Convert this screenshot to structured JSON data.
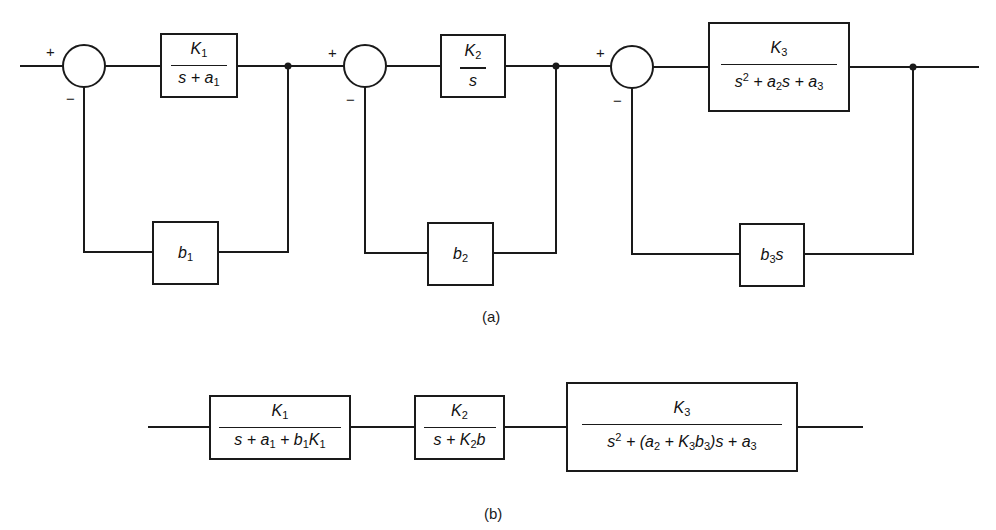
{
  "diagram_a": {
    "label": "(a)",
    "summing_junctions": [
      {
        "id": "sum1",
        "plus": "+",
        "minus": "−"
      },
      {
        "id": "sum2",
        "plus": "+",
        "minus": "−"
      },
      {
        "id": "sum3",
        "plus": "+",
        "minus": "−"
      }
    ],
    "forward_blocks": [
      {
        "id": "G1",
        "numerator": "K1",
        "denominator": "s + a1"
      },
      {
        "id": "G2",
        "numerator": "K2",
        "denominator": "s"
      },
      {
        "id": "G3",
        "numerator": "K3",
        "denominator": "s2 + a2s + a3"
      }
    ],
    "feedback_blocks": [
      {
        "id": "H1",
        "gain": "b1"
      },
      {
        "id": "H2",
        "gain": "b2"
      },
      {
        "id": "H3",
        "gain": "b3s"
      }
    ]
  },
  "diagram_b": {
    "label": "(b)",
    "blocks": [
      {
        "id": "T1",
        "numerator": "K1",
        "denominator": "s + a1 + b1K1"
      },
      {
        "id": "T2",
        "numerator": "K2",
        "denominator": "s + K2b"
      },
      {
        "id": "T3",
        "numerator": "K3",
        "denominator": "s2 + (a2 + K3b3)s + a3"
      }
    ]
  }
}
